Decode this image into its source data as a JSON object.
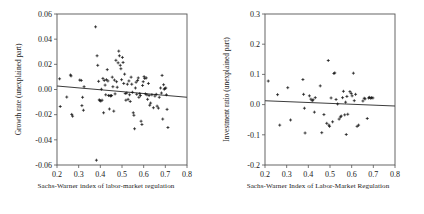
{
  "figure": {
    "panels": [
      "growth",
      "investment"
    ]
  },
  "chart_data": [
    {
      "type": "scatter",
      "id": "growth",
      "title": "",
      "xlabel": "Sachs-Warner index of labor-market regulation",
      "ylabel": "Growth rate (unexplained part)",
      "xlim": [
        0.2,
        0.8
      ],
      "ylim": [
        -0.06,
        0.06
      ],
      "xticks": [
        0.2,
        0.3,
        0.4,
        0.5,
        0.6,
        0.7,
        0.8
      ],
      "xtick_labels": [
        "0.2",
        "0.3",
        "0.4",
        "0.5",
        "0.6",
        "0.7",
        "0.8"
      ],
      "yticks": [
        -0.06,
        -0.04,
        -0.02,
        0.0,
        0.02,
        0.04,
        0.06
      ],
      "ytick_labels": [
        "-0.06",
        "-0.04",
        "-0.02",
        "0.00",
        "0.02",
        "0.04",
        "0.06"
      ],
      "grid": false,
      "legend": "none",
      "marker": "plus",
      "trendline": {
        "x0": 0.2,
        "y0": 0.0028,
        "x1": 0.8,
        "y1": -0.0062
      },
      "points": [
        [
          0.212,
          0.0085
        ],
        [
          0.215,
          -0.0135
        ],
        [
          0.245,
          -0.006
        ],
        [
          0.262,
          0.0115
        ],
        [
          0.265,
          0.0108
        ],
        [
          0.268,
          -0.0198
        ],
        [
          0.272,
          -0.0212
        ],
        [
          0.305,
          0.0075
        ],
        [
          0.312,
          0.0072
        ],
        [
          0.315,
          -0.0128
        ],
        [
          0.318,
          -0.0062
        ],
        [
          0.322,
          -0.0165
        ],
        [
          0.325,
          0.0022
        ],
        [
          0.378,
          0.0498
        ],
        [
          0.382,
          -0.0562
        ],
        [
          0.385,
          0.0268
        ],
        [
          0.388,
          0.0192
        ],
        [
          0.392,
          0.0065
        ],
        [
          0.395,
          -0.0082
        ],
        [
          0.398,
          -0.0088
        ],
        [
          0.402,
          -0.0092
        ],
        [
          0.405,
          0.0002
        ],
        [
          0.408,
          -0.0085
        ],
        [
          0.412,
          0.0088
        ],
        [
          0.415,
          -0.0185
        ],
        [
          0.418,
          0.0072
        ],
        [
          0.422,
          0.0035
        ],
        [
          0.425,
          -0.0042
        ],
        [
          0.428,
          0.0078
        ],
        [
          0.432,
          0.0158
        ],
        [
          0.435,
          0.0068
        ],
        [
          0.438,
          -0.0048
        ],
        [
          0.442,
          -0.0155
        ],
        [
          0.445,
          -0.0048
        ],
        [
          0.448,
          -0.0052
        ],
        [
          0.452,
          -0.0048
        ],
        [
          0.455,
          0.0098
        ],
        [
          0.458,
          0.0022
        ],
        [
          0.462,
          -0.0172
        ],
        [
          0.465,
          0.0075
        ],
        [
          0.468,
          -0.0035
        ],
        [
          0.472,
          0.0232
        ],
        [
          0.475,
          0.0062
        ],
        [
          0.478,
          0.0018
        ],
        [
          0.482,
          0.0212
        ],
        [
          0.485,
          0.0305
        ],
        [
          0.488,
          0.0268
        ],
        [
          0.492,
          0.0192
        ],
        [
          0.495,
          0.0165
        ],
        [
          0.498,
          0.0078
        ],
        [
          0.502,
          0.0255
        ],
        [
          0.505,
          0.0215
        ],
        [
          0.508,
          0.0048
        ],
        [
          0.512,
          0.0122
        ],
        [
          0.515,
          -0.0032
        ],
        [
          0.518,
          -0.0085
        ],
        [
          0.522,
          -0.0028
        ],
        [
          0.525,
          0.0042
        ],
        [
          0.528,
          -0.0078
        ],
        [
          0.532,
          0.0068
        ],
        [
          0.535,
          -0.0042
        ],
        [
          0.538,
          -0.0095
        ],
        [
          0.542,
          0.0098
        ],
        [
          0.545,
          0.0042
        ],
        [
          0.548,
          -0.0022
        ],
        [
          0.552,
          -0.0185
        ],
        [
          0.555,
          -0.0205
        ],
        [
          0.558,
          -0.0312
        ],
        [
          0.562,
          0.0012
        ],
        [
          0.565,
          0.0058
        ],
        [
          0.568,
          -0.0038
        ],
        [
          0.572,
          0.0072
        ],
        [
          0.575,
          0.0092
        ],
        [
          0.578,
          -0.0062
        ],
        [
          0.582,
          -0.0032
        ],
        [
          0.585,
          -0.0048
        ],
        [
          0.588,
          -0.0252
        ],
        [
          0.592,
          -0.0278
        ],
        [
          0.595,
          0.0032
        ],
        [
          0.598,
          0.0062
        ],
        [
          0.602,
          0.0102
        ],
        [
          0.605,
          0.0088
        ],
        [
          0.608,
          -0.0035
        ],
        [
          0.612,
          0.0092
        ],
        [
          0.615,
          -0.0042
        ],
        [
          0.618,
          -0.0078
        ],
        [
          0.622,
          0.0048
        ],
        [
          0.625,
          -0.0048
        ],
        [
          0.628,
          -0.0125
        ],
        [
          0.632,
          -0.0108
        ],
        [
          0.638,
          -0.0042
        ],
        [
          0.645,
          -0.0145
        ],
        [
          0.652,
          -0.0052
        ],
        [
          0.658,
          -0.0038
        ],
        [
          0.662,
          -0.0132
        ],
        [
          0.668,
          -0.0148
        ],
        [
          0.672,
          -0.0062
        ],
        [
          0.678,
          0.0012
        ],
        [
          0.682,
          -0.0028
        ],
        [
          0.685,
          0.0112
        ],
        [
          0.688,
          -0.0235
        ],
        [
          0.692,
          0.0038
        ],
        [
          0.695,
          0.0002
        ],
        [
          0.698,
          0.0008
        ],
        [
          0.702,
          0.0012
        ],
        [
          0.705,
          -0.0042
        ],
        [
          0.708,
          -0.0158
        ],
        [
          0.712,
          -0.0302
        ]
      ]
    },
    {
      "type": "scatter",
      "id": "investment",
      "title": "",
      "xlabel": "Sachs-Warner Index of Labor-Market Regulation",
      "ylabel": "Investment ratio (unexplained part)",
      "xlim": [
        0.2,
        0.8
      ],
      "ylim": [
        -0.2,
        0.3
      ],
      "xticks": [
        0.2,
        0.3,
        0.4,
        0.5,
        0.6,
        0.7,
        0.8
      ],
      "xtick_labels": [
        "0.2",
        "0.3",
        "0.4",
        "0.5",
        "0.6",
        "0.7",
        "0.8"
      ],
      "yticks": [
        -0.2,
        -0.1,
        0.0,
        0.1,
        0.2,
        0.3
      ],
      "ytick_labels": [
        "-0.2",
        "-0.1",
        "0.0",
        "0.1",
        "0.2",
        "0.3"
      ],
      "grid": false,
      "legend": "none",
      "marker": "plus",
      "trendline": {
        "x0": 0.2,
        "y0": 0.0125,
        "x1": 0.8,
        "y1": -0.0045
      },
      "points": [
        [
          0.215,
          0.078
        ],
        [
          0.258,
          0.033
        ],
        [
          0.268,
          -0.068
        ],
        [
          0.305,
          0.056
        ],
        [
          0.318,
          -0.051
        ],
        [
          0.375,
          0.083
        ],
        [
          0.378,
          0.034
        ],
        [
          0.382,
          -0.012
        ],
        [
          0.385,
          -0.094
        ],
        [
          0.405,
          0.029
        ],
        [
          0.412,
          0.018
        ],
        [
          0.418,
          0.013
        ],
        [
          0.422,
          0.016
        ],
        [
          0.428,
          -0.025
        ],
        [
          0.432,
          0.023
        ],
        [
          0.455,
          0.062
        ],
        [
          0.462,
          -0.093
        ],
        [
          0.472,
          -0.033
        ],
        [
          0.485,
          -0.062
        ],
        [
          0.492,
          0.146
        ],
        [
          0.495,
          -0.068
        ],
        [
          0.498,
          -0.072
        ],
        [
          0.505,
          0.022
        ],
        [
          0.512,
          -0.057
        ],
        [
          0.518,
          0.103
        ],
        [
          0.522,
          0.105
        ],
        [
          0.528,
          0.017
        ],
        [
          0.535,
          0.002
        ],
        [
          0.542,
          -0.048
        ],
        [
          0.548,
          -0.041
        ],
        [
          0.552,
          -0.038
        ],
        [
          0.558,
          0.023
        ],
        [
          0.562,
          0.044
        ],
        [
          0.568,
          -0.034
        ],
        [
          0.572,
          0.008
        ],
        [
          0.575,
          -0.099
        ],
        [
          0.578,
          0.027
        ],
        [
          0.582,
          -0.032
        ],
        [
          0.592,
          0.043
        ],
        [
          0.598,
          0.037
        ],
        [
          0.602,
          0.029
        ],
        [
          0.608,
          0.104
        ],
        [
          0.612,
          0.013
        ],
        [
          0.618,
          0.034
        ],
        [
          0.625,
          -0.072
        ],
        [
          0.632,
          -0.068
        ],
        [
          0.652,
          0.012
        ],
        [
          0.658,
          0.021
        ],
        [
          0.662,
          0.019
        ],
        [
          0.672,
          -0.046
        ],
        [
          0.678,
          0.022
        ],
        [
          0.682,
          0.024
        ],
        [
          0.688,
          0.021
        ],
        [
          0.692,
          0.023
        ],
        [
          0.698,
          0.022
        ]
      ]
    }
  ]
}
